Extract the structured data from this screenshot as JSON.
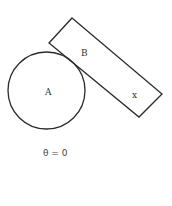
{
  "diagram": {
    "circle": {
      "label": "A",
      "cx": 46.5,
      "cy": 90.5,
      "r": 38.5
    },
    "rectangle": {
      "label_top": "B",
      "label_bottom": "x",
      "points": "72,18 162,94 139,117 49,43"
    },
    "caption": "θ = 0",
    "stroke_color": "#2a2a2a"
  }
}
